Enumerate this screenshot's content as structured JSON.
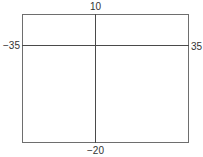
{
  "viewing_window": {
    "xmin": "−35",
    "xmax": "35",
    "ymin": "−20",
    "ymax": "10"
  },
  "colors": {
    "frame": "#6e6e6e",
    "axes": "#4a4a4a",
    "text": "#333333",
    "background": "#ffffff"
  }
}
